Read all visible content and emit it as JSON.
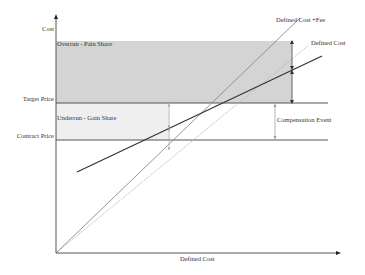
{
  "diagram": {
    "type": "target cost contract pain/gain share diagram",
    "axes": {
      "y_label": "Cost",
      "x_label": "Defined Cost"
    },
    "levels": {
      "target_price": "Target Price",
      "contract_price": "Contract Price"
    },
    "regions": {
      "overrun": "Overrun - Pain Share",
      "underrun": "Underrun - Gain Share"
    },
    "lines": {
      "defined_cost_plus_fee": "Defined Cost +Fee",
      "defined_cost": "Defined Cost"
    },
    "annotations": {
      "compensation_event": "Compensation Event"
    },
    "colors": {
      "overrun_fill": "#d4d4d4",
      "underrun_fill": "#efefef",
      "axis": "#555555",
      "share_line": "#333333",
      "fee_line": "#8a8a8a",
      "defined_cost_line": "#b8b8b8"
    }
  }
}
